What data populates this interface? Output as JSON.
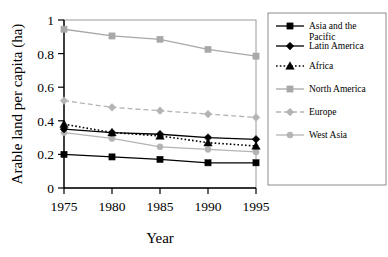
{
  "chart_data": {
    "type": "line",
    "title": "",
    "xlabel": "Year",
    "ylabel": "Arable land per capita (ha)",
    "x": [
      1975,
      1980,
      1985,
      1990,
      1995
    ],
    "xtick_labels": [
      "1975",
      "1980",
      "1985",
      "1990",
      "1995"
    ],
    "ytick_labels": [
      "0",
      "0.2",
      "0.4",
      "0.6",
      "0.8",
      "1"
    ],
    "ytick_values": [
      0,
      0.2,
      0.4,
      0.6,
      0.8,
      1
    ],
    "xlim": [
      1975,
      1995
    ],
    "ylim": [
      0,
      1
    ],
    "grid": false,
    "legend_position": "right",
    "series": [
      {
        "name": "Asia and the Pacific",
        "legend_label_line1": "Asia and the",
        "legend_label_line2": "Pacific",
        "values": [
          0.2,
          0.185,
          0.17,
          0.15,
          0.15
        ],
        "color": "#000000",
        "marker": "square",
        "line_style": "solid"
      },
      {
        "name": "Latin America",
        "legend_label_line1": "Latin America",
        "legend_label_line2": "",
        "values": [
          0.35,
          0.33,
          0.32,
          0.3,
          0.29
        ],
        "color": "#000000",
        "marker": "diamond",
        "line_style": "solid"
      },
      {
        "name": "Africa",
        "legend_label_line1": "Africa",
        "legend_label_line2": "",
        "values": [
          0.38,
          0.33,
          0.31,
          0.27,
          0.25
        ],
        "color": "#000000",
        "marker": "triangle",
        "line_style": "dotted"
      },
      {
        "name": "North America",
        "legend_label_line1": "North America",
        "legend_label_line2": "",
        "values": [
          0.945,
          0.905,
          0.885,
          0.825,
          0.785
        ],
        "color": "#a8a8a8",
        "marker": "square",
        "line_style": "solid"
      },
      {
        "name": "Europe",
        "legend_label_line1": "Europe",
        "legend_label_line2": "",
        "values": [
          0.52,
          0.48,
          0.46,
          0.44,
          0.42
        ],
        "color": "#b4b4b4",
        "marker": "diamond",
        "line_style": "dashed"
      },
      {
        "name": "West Asia",
        "legend_label_line1": "West Asia",
        "legend_label_line2": "",
        "values": [
          0.33,
          0.295,
          0.245,
          0.23,
          0.215
        ],
        "color": "#b4b4b4",
        "marker": "circle",
        "line_style": "solid"
      }
    ]
  },
  "axes": {
    "y_title": "Arable land per capita (ha)",
    "x_title": "Year"
  },
  "colors": {
    "axis": "#000000",
    "frame": "#9a9a9a",
    "dark_series": "#000000",
    "light_series": "#b4b4b4",
    "background": "#ffffff"
  }
}
